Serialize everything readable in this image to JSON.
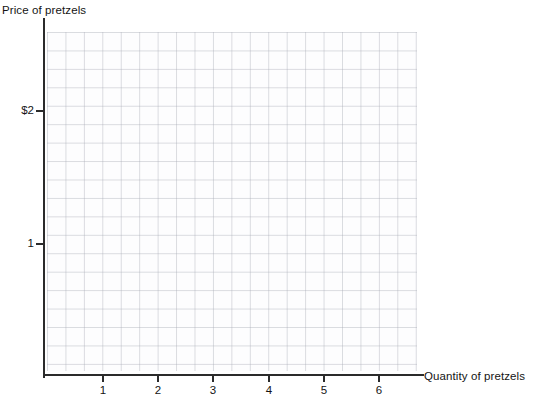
{
  "figure": {
    "kind": "blank-coordinate-grid",
    "background_color": "#ffffff",
    "axis_color": "#2b2b2b",
    "grid_color": "#787d8c"
  },
  "axes": {
    "y_title": "Price of pretzels",
    "x_title": "Quantity of pretzels"
  },
  "chart_data": {
    "type": "scatter",
    "title": "",
    "subtitle": "",
    "xlabel": "Quantity of pretzels",
    "ylabel": "Price of pretzels",
    "xlim": [
      0,
      6.9
    ],
    "ylim": [
      0,
      2.55
    ],
    "x_ticks": [
      1,
      2,
      3,
      4,
      5,
      6
    ],
    "x_tick_labels": [
      "1",
      "2",
      "3",
      "4",
      "5",
      "6"
    ],
    "y_ticks": [
      1,
      2
    ],
    "y_tick_labels": [
      "1",
      "$2"
    ],
    "grid": true,
    "grid_cell_units_x": 0.333,
    "grid_cell_units_y": 0.135,
    "legend": null,
    "legend_position": "none",
    "series": [],
    "annotations": [],
    "note": "Empty graph: grid and labeled axes only, no plotted data points or curves."
  },
  "x_ticks": [
    {
      "label": "1",
      "px": 102
    },
    {
      "label": "2",
      "px": 157
    },
    {
      "label": "3",
      "px": 212
    },
    {
      "label": "4",
      "px": 268
    },
    {
      "label": "5",
      "px": 323
    },
    {
      "label": "6",
      "px": 378
    }
  ],
  "y_ticks": [
    {
      "label": "$2",
      "px": 110
    },
    {
      "label": "1",
      "px": 243
    }
  ]
}
